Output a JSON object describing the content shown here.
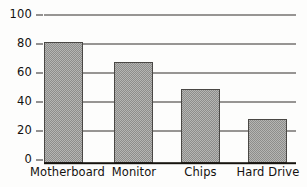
{
  "chart_data": {
    "type": "bar",
    "title": "",
    "subtitle": "",
    "xlabel": "",
    "ylabel": "",
    "categories": [
      "Motherboard",
      "Monitor",
      "Chips",
      "Hard Drive"
    ],
    "values": [
      82,
      68,
      50,
      30
    ],
    "ylim": [
      0,
      100
    ],
    "ytick_labels": [
      "100",
      "80",
      "60",
      "40",
      "20",
      "0"
    ],
    "ytick_values": [
      100,
      80,
      60,
      40,
      20,
      0
    ],
    "grid": true,
    "legend": null,
    "legend_position": "none",
    "annotations": [],
    "colors": {
      "bar_fill": "#a2a2a0",
      "bar_fill_light": "#b5b5b3",
      "bar_fill_dark": "#8d8d8b",
      "bar_border": "#4a4845",
      "gridline": "#332f2b",
      "axis": "#17140f",
      "text": "#14110f",
      "background": "#fdfdfc"
    }
  }
}
